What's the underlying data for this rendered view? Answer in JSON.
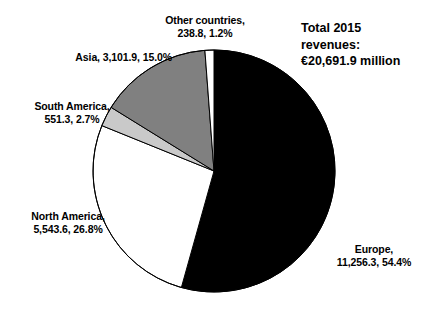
{
  "chart_data": {
    "type": "pie",
    "title": "",
    "subtitle": "",
    "xlabel": "",
    "ylabel": "",
    "legend_position": "callout-labels",
    "grid": false,
    "units": "€ million",
    "total_label": "Total  2015\nrevenues:\n€20,691.9 million",
    "total_value": 20691.9,
    "total_value_text": "€20,691.9 million",
    "year": "2015",
    "start_angle_deg": 0,
    "direction": "clockwise",
    "categories": [
      "Europe",
      "North America",
      "South America",
      "Asia",
      "Other countries"
    ],
    "values": [
      11256.3,
      5543.6,
      551.3,
      3101.9,
      238.8
    ],
    "percents": [
      54.4,
      26.8,
      2.7,
      15.0,
      1.2
    ],
    "colors": [
      "#000000",
      "#ffffff",
      "#c9c9c9",
      "#808080",
      "#ffffff"
    ],
    "slices": [
      {
        "name": "Europe",
        "value": 11256.3,
        "value_text": "11,256.3",
        "percent": 54.4,
        "percent_text": "54.4%",
        "color": "#000000",
        "label_line1": "Europe,",
        "label_line2": "11,256.3, 54.4%"
      },
      {
        "name": "North America",
        "value": 5543.6,
        "value_text": "5,543.6",
        "percent": 26.8,
        "percent_text": "26.8%",
        "color": "#ffffff",
        "label_line1": "North America,",
        "label_line2": "5,543.6, 26.8%"
      },
      {
        "name": "South America",
        "value": 551.3,
        "value_text": "551.3",
        "percent": 2.7,
        "percent_text": "2.7%",
        "color": "#c9c9c9",
        "label_line1": "South America,",
        "label_line2": "551.3, 2.7%"
      },
      {
        "name": "Asia",
        "value": 3101.9,
        "value_text": "3,101.9",
        "percent": 15.0,
        "percent_text": "15.0%",
        "color": "#808080",
        "label_line1": "Asia, 3,101.9, 15.0%",
        "label_line2": ""
      },
      {
        "name": "Other countries",
        "value": 238.8,
        "value_text": "238.8",
        "percent": 1.2,
        "percent_text": "1.2%",
        "color": "#ffffff",
        "label_line1": "Other countries,",
        "label_line2": "238.8, 1.2%"
      }
    ]
  },
  "labels": {
    "other": "Other countries,\n238.8, 1.2%",
    "asia": "Asia, 3,101.9, 15.0%",
    "south_america": "South America,\n551.3, 2.7%",
    "north_america": "North America,\n5,543.6, 26.8%",
    "europe": "Europe,\n11,256.3, 54.4%"
  },
  "annotations": {
    "total": "Total  2015\nrevenues:\n€20,691.9 million"
  },
  "style": {
    "stroke": "#000000",
    "background": "#ffffff"
  }
}
